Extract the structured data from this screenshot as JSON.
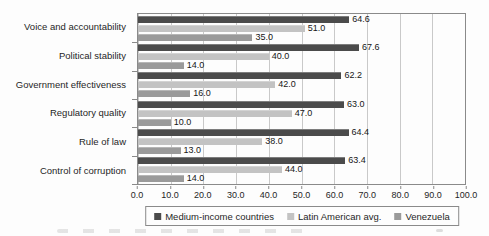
{
  "chart_data": {
    "type": "bar",
    "orientation": "horizontal",
    "title": "",
    "categories": [
      "Voice and accountability",
      "Political stability",
      "Government effectiveness",
      "Regulatory quality",
      "Rule of law",
      "Control of corruption"
    ],
    "series": [
      {
        "name": "Medium-income countries",
        "color": "#4b4b4b",
        "values": [
          64.6,
          67.6,
          62.2,
          63.0,
          64.4,
          63.4
        ]
      },
      {
        "name": "Latin American avg.",
        "color": "#c3c3c3",
        "values": [
          51.0,
          40.0,
          42.0,
          47.0,
          38.0,
          44.0
        ]
      },
      {
        "name": "Venezuela",
        "color": "#9a9a9a",
        "values": [
          35.0,
          14.0,
          16.0,
          10.0,
          13.0,
          14.0
        ]
      }
    ],
    "xlabel": "",
    "ylabel": "",
    "xlim": [
      0,
      100
    ],
    "x_ticks": [
      "0.0",
      "10.0",
      "20.0",
      "30.0",
      "40.0",
      "50.0",
      "60.0",
      "70.0",
      "80.0",
      "90.0",
      "100.0"
    ],
    "grid": true,
    "value_labels": true,
    "legend_position": "bottom"
  },
  "colors": {
    "grid": "#c9c9c9",
    "axis_border": "#8a8a8a",
    "text": "#1f1f1f",
    "background": "#fdfdfd"
  }
}
